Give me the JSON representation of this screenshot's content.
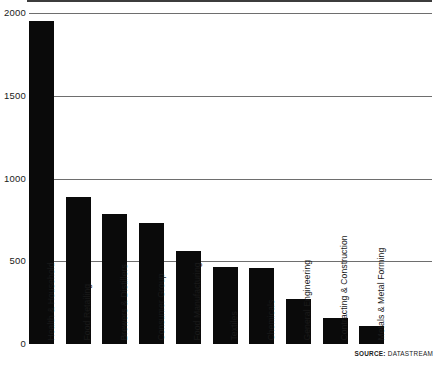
{
  "chart_data": {
    "type": "bar",
    "title": "",
    "xlabel": "",
    "ylabel": "",
    "ylim": [
      0,
      2000
    ],
    "yticks": [
      0,
      500,
      1000,
      1500,
      2000
    ],
    "ytick_labels": [
      "0",
      "500",
      "1000",
      "1500",
      "2000"
    ],
    "grid": true,
    "legend": false,
    "orientation": "vertical",
    "bar_color": "#0a0a0a",
    "gridline_color": "#6e6e6e",
    "categories": [
      "Health & Household",
      "Food Retailing",
      "Brewers & Distillers",
      "Consumer Group",
      "Food Manufacturing",
      "Textiles",
      "Chemicals",
      "General Engineering",
      "Contracting & Construction",
      "Metals & Metal Forming"
    ],
    "values": [
      1950,
      890,
      785,
      730,
      565,
      465,
      460,
      270,
      160,
      110
    ],
    "note": "An eleventh unlabeled bar is drawn between Textiles and Chemicals groupings in the source image; label set follows the visible rotated captions.",
    "bars": [
      {
        "category": "Health & Household",
        "value": 1950
      },
      {
        "category": "Food Retailing",
        "value": 890
      },
      {
        "category": "Brewers & Distillers",
        "value": 785
      },
      {
        "category": "Consumer Group",
        "value": 730
      },
      {
        "category": "Food Manufacturing",
        "value": 565
      },
      {
        "category": "Textiles",
        "value": 465
      },
      {
        "category": "Chemicals",
        "value": 460
      },
      {
        "category": "General Engineering",
        "value": 270
      },
      {
        "category": "Contracting & Construction",
        "value": 160
      },
      {
        "category": "Metals & Metal Forming",
        "value": 110
      }
    ]
  },
  "source": {
    "key": "SOURCE:",
    "value": "DATASTREAM"
  }
}
